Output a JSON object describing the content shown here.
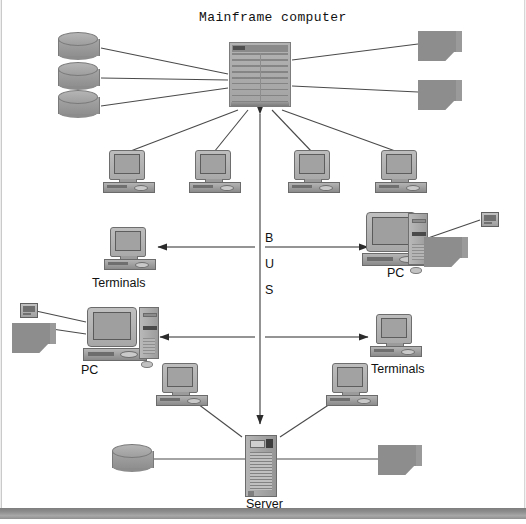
{
  "diagram": {
    "title": "Mainframe computer",
    "bus_label": [
      "B",
      "U",
      "S"
    ],
    "labels": {
      "terminals_left": "Terminals",
      "terminals_right": "Terminals",
      "pc_right": "PC",
      "pc_left": "PC",
      "server": "Server"
    },
    "icons": {
      "mainframe": "mainframe-computer-icon",
      "disk": "disk-storage-icon",
      "printer": "printer-icon",
      "terminal": "desktop-terminal-icon",
      "pc": "personal-computer-icon",
      "tower": "computer-tower-icon",
      "server": "server-tower-icon",
      "minidevice": "small-device-icon",
      "mouse": "mouse-icon"
    },
    "colors": {
      "device_gray": "#9a9a9a",
      "line": "#4a4a4a",
      "background": "#ffffff",
      "bottom_bar": "#8e8e8e"
    },
    "nodes": {
      "top_disks": 3,
      "top_printers": 2,
      "terminal_row": 4,
      "bottom_terminals": 2
    }
  }
}
